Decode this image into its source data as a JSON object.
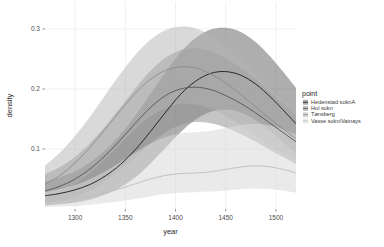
{
  "chart_data": {
    "type": "area",
    "title": "",
    "xlabel": "year",
    "ylabel": "density",
    "xlim": [
      1270,
      1520
    ],
    "ylim": [
      0,
      0.345
    ],
    "xticks": [
      1300,
      1350,
      1400,
      1450,
      1500
    ],
    "xticklabels": [
      "1300",
      "1350",
      "1400",
      "1450",
      "1500"
    ],
    "yticks": [
      0.1,
      0.2,
      0.3
    ],
    "yticklabels": [
      "0.1",
      "0.2",
      "0.3"
    ],
    "grid": true,
    "grid_color": "#ffffff",
    "panel_background": "#ffffff",
    "legend": {
      "title": "point",
      "position": "right",
      "entries": [
        {
          "label": "Hedenstad soknA",
          "swatch": "#6b6b6b",
          "line": "#1a1a1a"
        },
        {
          "label": "Hol sokn",
          "swatch": "#8c8c8c",
          "line": "#555555"
        },
        {
          "label": "Tønsberg",
          "swatch": "#b4b4b4",
          "line": "#8a8a8a"
        },
        {
          "label": "Vasse sokn/Vatnays",
          "swatch": "#d8d8d8",
          "line": "#bdbdbd"
        }
      ]
    },
    "x": [
      1270,
      1285,
      1300,
      1315,
      1330,
      1345,
      1360,
      1375,
      1390,
      1405,
      1420,
      1435,
      1450,
      1465,
      1480,
      1495,
      1510,
      1520
    ],
    "series": [
      {
        "name": "Hedenstad soknA",
        "color": "#1a1a1a",
        "ribbon_color": "#6b6b6b",
        "ribbon_opacity": 0.55,
        "mean": [
          0.022,
          0.026,
          0.032,
          0.041,
          0.055,
          0.074,
          0.099,
          0.129,
          0.161,
          0.191,
          0.213,
          0.226,
          0.229,
          0.223,
          0.208,
          0.186,
          0.16,
          0.142
        ],
        "lower": [
          0.006,
          0.008,
          0.011,
          0.016,
          0.024,
          0.036,
          0.053,
          0.076,
          0.102,
          0.128,
          0.149,
          0.162,
          0.166,
          0.161,
          0.148,
          0.129,
          0.107,
          0.093
        ],
        "upper": [
          0.046,
          0.053,
          0.063,
          0.078,
          0.098,
          0.124,
          0.156,
          0.192,
          0.228,
          0.261,
          0.285,
          0.299,
          0.302,
          0.295,
          0.278,
          0.253,
          0.223,
          0.202
        ]
      },
      {
        "name": "Hol sokn",
        "color": "#555555",
        "ribbon_color": "#8c8c8c",
        "ribbon_opacity": 0.5,
        "mean": [
          0.03,
          0.038,
          0.05,
          0.067,
          0.089,
          0.115,
          0.143,
          0.169,
          0.189,
          0.2,
          0.203,
          0.199,
          0.189,
          0.176,
          0.16,
          0.142,
          0.124,
          0.112
        ],
        "lower": [
          0.01,
          0.014,
          0.021,
          0.031,
          0.046,
          0.065,
          0.087,
          0.109,
          0.128,
          0.14,
          0.145,
          0.143,
          0.136,
          0.125,
          0.112,
          0.098,
          0.084,
          0.075
        ],
        "upper": [
          0.058,
          0.07,
          0.087,
          0.11,
          0.138,
          0.169,
          0.201,
          0.23,
          0.252,
          0.265,
          0.268,
          0.263,
          0.251,
          0.235,
          0.216,
          0.194,
          0.172,
          0.157
        ]
      },
      {
        "name": "Tønsberg",
        "color": "#8a8a8a",
        "ribbon_color": "#b4b4b4",
        "ribbon_opacity": 0.5,
        "mean": [
          0.041,
          0.056,
          0.077,
          0.103,
          0.133,
          0.164,
          0.193,
          0.216,
          0.231,
          0.237,
          0.235,
          0.225,
          0.21,
          0.191,
          0.17,
          0.149,
          0.13,
          0.117
        ],
        "lower": [
          0.018,
          0.027,
          0.041,
          0.06,
          0.083,
          0.108,
          0.133,
          0.154,
          0.168,
          0.175,
          0.174,
          0.167,
          0.155,
          0.14,
          0.123,
          0.106,
          0.091,
          0.081
        ],
        "upper": [
          0.072,
          0.094,
          0.122,
          0.154,
          0.19,
          0.225,
          0.257,
          0.282,
          0.298,
          0.304,
          0.301,
          0.289,
          0.271,
          0.249,
          0.224,
          0.199,
          0.176,
          0.16
        ]
      },
      {
        "name": "Vasse sokn/Vatnays",
        "color": "#bdbdbd",
        "ribbon_color": "#d8d8d8",
        "ribbon_opacity": 0.55,
        "mean": [
          0.012,
          0.014,
          0.017,
          0.021,
          0.027,
          0.034,
          0.042,
          0.05,
          0.056,
          0.059,
          0.06,
          0.062,
          0.066,
          0.07,
          0.072,
          0.07,
          0.065,
          0.06
        ],
        "lower": [
          0.003,
          0.004,
          0.005,
          0.007,
          0.01,
          0.013,
          0.017,
          0.021,
          0.025,
          0.027,
          0.028,
          0.029,
          0.031,
          0.033,
          0.034,
          0.033,
          0.03,
          0.027
        ],
        "upper": [
          0.028,
          0.033,
          0.04,
          0.05,
          0.063,
          0.078,
          0.094,
          0.109,
          0.12,
          0.126,
          0.128,
          0.13,
          0.135,
          0.14,
          0.142,
          0.139,
          0.131,
          0.124
        ]
      }
    ]
  }
}
